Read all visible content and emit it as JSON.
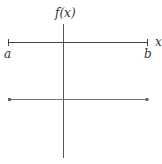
{
  "diagram": {
    "labels": {
      "y_axis": "f(x)",
      "x_axis": "x",
      "left_endpoint": "a",
      "right_endpoint": "b"
    },
    "colors": {
      "axis": "#444444",
      "line": "#777777",
      "text": "#333333",
      "background": "#ffffff"
    }
  }
}
